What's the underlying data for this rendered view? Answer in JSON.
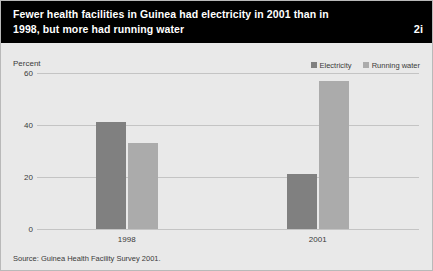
{
  "header": {
    "title": "Fewer health facilities in Guinea had electricity in 2001 than in 1998, but more had running water",
    "figure_number": "2i",
    "background_color": "#000000",
    "text_color": "#ffffff"
  },
  "source": {
    "note": "Source: Guinea Health Facility Survey 2001."
  },
  "legend": {
    "position": "top-right",
    "entries": [
      {
        "label": "Electricity",
        "color": "#808080"
      },
      {
        "label": "Running water",
        "color": "#ababab"
      }
    ]
  },
  "chart_data": {
    "type": "bar",
    "title": "Fewer health facilities in Guinea had electricity in 2001 than in 1998, but more had running water",
    "subtitle": "",
    "xlabel": "",
    "ylabel": "Percent",
    "ylim": [
      0,
      60
    ],
    "yticks": [
      0,
      20,
      40,
      60
    ],
    "ytick_labels": [
      "0",
      "20",
      "40",
      "60"
    ],
    "grid": true,
    "categories": [
      "1998",
      "2001"
    ],
    "series": [
      {
        "name": "Electricity",
        "color": "#808080",
        "values": [
          41,
          21
        ]
      },
      {
        "name": "Running water",
        "color": "#ababab",
        "values": [
          33,
          57
        ]
      }
    ],
    "annotations": []
  }
}
